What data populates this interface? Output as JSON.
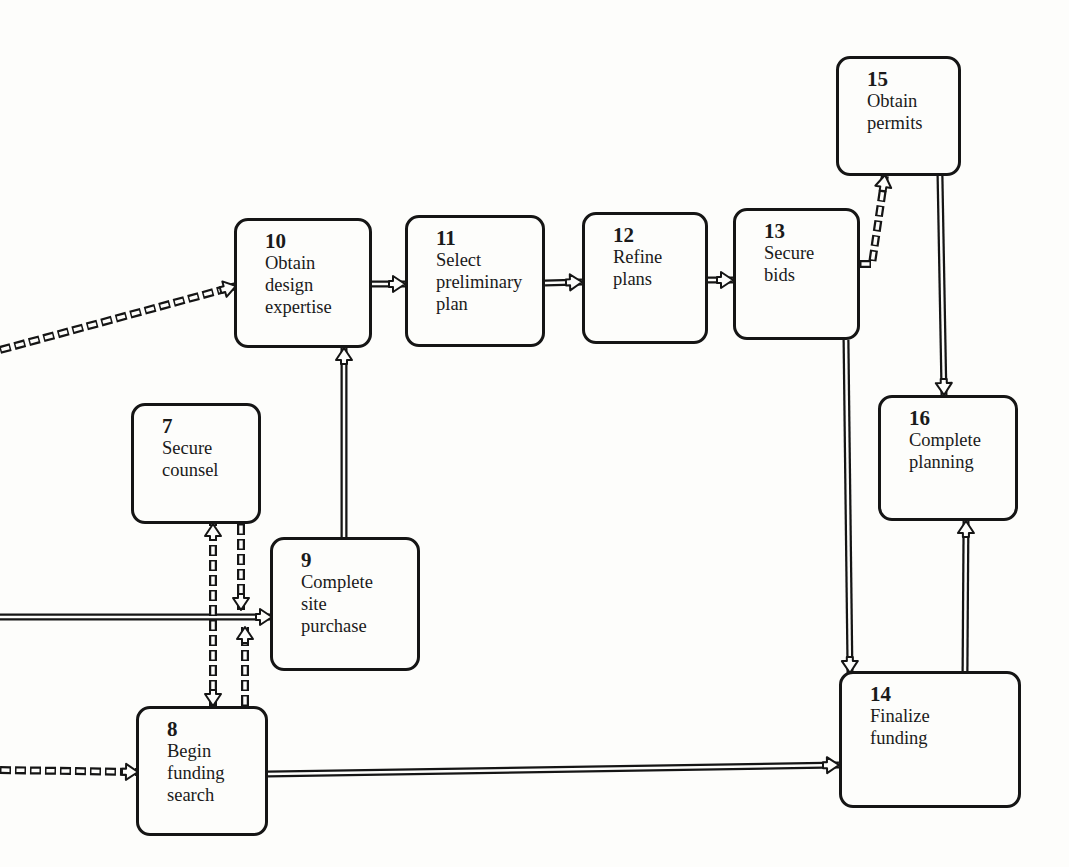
{
  "diagram": {
    "type": "flowchart",
    "nodes": [
      {
        "id": "10",
        "number": "10",
        "label": "Obtain\ndesign\nexpertise",
        "x": 234,
        "y": 218,
        "w": 138,
        "h": 130
      },
      {
        "id": "11",
        "number": "11",
        "label": "Select\npreliminary\nplan",
        "x": 405,
        "y": 215,
        "w": 140,
        "h": 132
      },
      {
        "id": "12",
        "number": "12",
        "label": "Refine\nplans",
        "x": 582,
        "y": 212,
        "w": 126,
        "h": 132
      },
      {
        "id": "13",
        "number": "13",
        "label": "Secure\nbids",
        "x": 733,
        "y": 208,
        "w": 127,
        "h": 132
      },
      {
        "id": "15",
        "number": "15",
        "label": "Obtain\npermits",
        "x": 836,
        "y": 56,
        "w": 125,
        "h": 120
      },
      {
        "id": "16",
        "number": "16",
        "label": "Complete\nplanning",
        "x": 878,
        "y": 395,
        "w": 140,
        "h": 126
      },
      {
        "id": "7",
        "number": "7",
        "label": "Secure\ncounsel",
        "x": 131,
        "y": 403,
        "w": 130,
        "h": 121
      },
      {
        "id": "9",
        "number": "9",
        "label": "Complete\nsite\npurchase",
        "x": 270,
        "y": 537,
        "w": 150,
        "h": 134
      },
      {
        "id": "8",
        "number": "8",
        "label": "Begin\nfunding\nsearch",
        "x": 136,
        "y": 706,
        "w": 132,
        "h": 130
      },
      {
        "id": "14",
        "number": "14",
        "label": "Finalize\nfunding",
        "x": 839,
        "y": 671,
        "w": 182,
        "h": 137
      }
    ],
    "edges": [
      {
        "from": "offscreen-left",
        "to": "10",
        "style": "dashed",
        "points": [
          [
            0,
            350
          ],
          [
            236,
            286
          ]
        ]
      },
      {
        "from": "10",
        "to": "11",
        "style": "solid",
        "points": [
          [
            372,
            284
          ],
          [
            405,
            284
          ]
        ]
      },
      {
        "from": "11",
        "to": "12",
        "style": "solid",
        "points": [
          [
            545,
            283
          ],
          [
            582,
            282
          ]
        ]
      },
      {
        "from": "12",
        "to": "13",
        "style": "solid",
        "points": [
          [
            708,
            280
          ],
          [
            733,
            280
          ]
        ]
      },
      {
        "from": "13",
        "to": "15",
        "style": "dashed",
        "points": [
          [
            860,
            264
          ],
          [
            872,
            264
          ],
          [
            885,
            175
          ]
        ]
      },
      {
        "from": "15",
        "to": "16",
        "style": "solid",
        "points": [
          [
            940,
            176
          ],
          [
            944,
            395
          ]
        ]
      },
      {
        "from": "13",
        "to": "14",
        "style": "solid",
        "points": [
          [
            846,
            340
          ],
          [
            850,
            673
          ]
        ]
      },
      {
        "from": "14",
        "to": "16",
        "style": "solid",
        "points": [
          [
            965,
            671
          ],
          [
            966,
            521
          ]
        ]
      },
      {
        "from": "9",
        "to": "10",
        "style": "solid",
        "points": [
          [
            344,
            537
          ],
          [
            344,
            348
          ]
        ]
      },
      {
        "from": "offscreen-left",
        "to": "9",
        "style": "solid",
        "points": [
          [
            0,
            617
          ],
          [
            272,
            617
          ]
        ]
      },
      {
        "from": "8",
        "to": "7",
        "style": "dashed",
        "points": [
          [
            213,
            706
          ],
          [
            213,
            524
          ]
        ],
        "bidirectional": true
      },
      {
        "from": "7",
        "to": "9",
        "style": "dashed",
        "points": [
          [
            241,
            524
          ],
          [
            241,
            610
          ]
        ]
      },
      {
        "from": "8",
        "to": "9",
        "style": "dashed",
        "points": [
          [
            245,
            706
          ],
          [
            245,
            627
          ]
        ]
      },
      {
        "from": "offscreen-left",
        "to": "8",
        "style": "dashed",
        "points": [
          [
            0,
            770
          ],
          [
            138,
            772
          ]
        ]
      },
      {
        "from": "8",
        "to": "14",
        "style": "solid",
        "points": [
          [
            268,
            774
          ],
          [
            839,
            765
          ]
        ]
      }
    ]
  }
}
